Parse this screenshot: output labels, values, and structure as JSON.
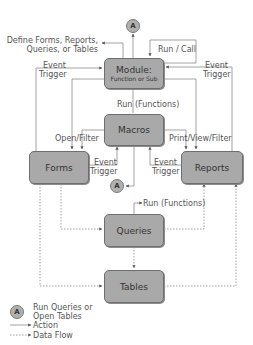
{
  "nodes": {
    "module": {
      "title": "Module:",
      "subtitle": "Function or Sub"
    },
    "macros": {
      "title": "Macros"
    },
    "forms": {
      "title": "Forms"
    },
    "reports": {
      "title": "Reports"
    },
    "queries": {
      "title": "Queries"
    },
    "tables": {
      "title": "Tables"
    }
  },
  "connector": {
    "label": "A"
  },
  "edge_labels": {
    "define": "Define Forms, Reports,\nQueries, or Tables",
    "define_line1": "Define Forms, Reports,",
    "define_line2": "Queries, or Tables",
    "run_call": "Run / Call",
    "event_trigger_left_1": "Event",
    "event_trigger_left_2": "Trigger",
    "event_trigger_right_1": "Event",
    "event_trigger_right_2": "Trigger",
    "run_functions_macros": "Run (Functions)",
    "open_filter": "Open/Filter",
    "print_view_filter": "Print/View/Filter",
    "forms_event_1": "Event",
    "forms_event_2": "Trigger",
    "reports_event_1": "Event",
    "reports_event_2": "Trigger",
    "run_functions_queries": "Run (Functions)"
  },
  "legend": {
    "circle_label": "A",
    "circle_text_1": "Run Queries or",
    "circle_text_2": "Open Tables",
    "action": "Action",
    "data_flow": "Data Flow"
  },
  "colors": {
    "box_fill": "#a9a9a9",
    "box_border": "#6e6e6e",
    "line": "#8a8a8a",
    "text": "#555555"
  }
}
